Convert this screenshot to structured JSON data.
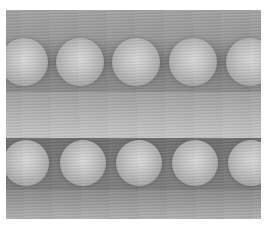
{
  "image": {
    "description": "Grayscale image of two horizontal rows of spheres",
    "rows": [
      {
        "name": "top-row",
        "sphere_count": 5,
        "centers_x": [
          18,
          74,
          130,
          187,
          244
        ],
        "center_y": 52,
        "radius": 24
      },
      {
        "name": "bottom-row",
        "sphere_count": 5,
        "centers_x": [
          20,
          77,
          133,
          189,
          245
        ],
        "center_y": 153,
        "radius": 23
      }
    ],
    "colors": {
      "background": "#ffffff",
      "sphere_highlight": "#d8d8d8",
      "sphere_edge": "#8d8d8d",
      "dark_gap": "#6f6f6f",
      "light_band": "#c2c2c2"
    }
  }
}
